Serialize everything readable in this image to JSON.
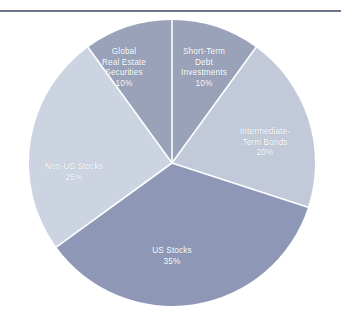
{
  "chart_data": {
    "type": "pie",
    "title": "",
    "subtitle": "",
    "xlabel": "",
    "ylabel": "",
    "legend_position": "none",
    "grid": false,
    "units": "percent",
    "total": 100,
    "start_angle_deg": 0,
    "direction": "clockwise",
    "categories": [
      "Short-Term Debt Investments",
      "Intermediate-Term Bonds",
      "US Stocks",
      "Non-US Stocks",
      "Global Real Estate Securities"
    ],
    "values": [
      10,
      20,
      35,
      25,
      10
    ],
    "slices": [
      {
        "name": "Short-Term Debt Investments",
        "label_lines": "Short-Term\nDebt\nInvestments",
        "value": 10,
        "pct_text": "10%",
        "color": "#99a2b9"
      },
      {
        "name": "Intermediate-Term Bonds",
        "label_lines": "Intermediate-\nTerm Bonds",
        "value": 20,
        "pct_text": "20%",
        "color": "#c2cada"
      },
      {
        "name": "US Stocks",
        "label_lines": "US Stocks",
        "value": 35,
        "pct_text": "35%",
        "color": "#8e98b6"
      },
      {
        "name": "Non-US Stocks",
        "label_lines": "Non-US Stocks",
        "value": 25,
        "pct_text": "25%",
        "color": "#ccd4e1"
      },
      {
        "name": "Global Real Estate Securities",
        "label_lines": "Global\nReal Estate\nSecurities",
        "value": 10,
        "pct_text": "10%",
        "color": "#99a2b9"
      }
    ]
  },
  "style": {
    "background": "#ffffff",
    "rule_color": "#6c7487",
    "slice_separator_color": "#ffffff",
    "label_color": "#ffffff"
  }
}
